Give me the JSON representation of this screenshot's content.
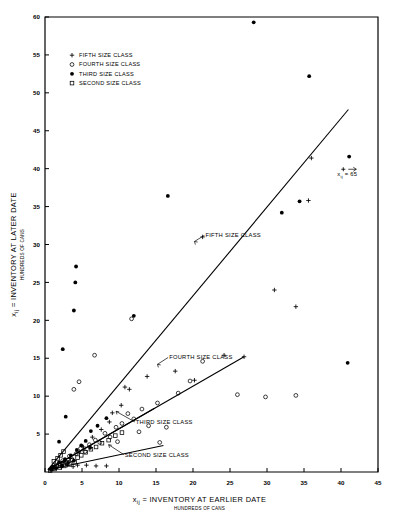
{
  "chart_data": {
    "type": "scatter",
    "title": "",
    "xlabel": "x ij = INVENTORY AT EARLIER DATE",
    "xlabel_sub": "HUNDREDS OF CANS",
    "ylabel": "x ij = INVENTORY AT LATER DATE",
    "ylabel_sub": "HUNDREDS OF CANS",
    "xlim": [
      0,
      45
    ],
    "ylim": [
      0,
      60
    ],
    "xticks": [
      0,
      5,
      10,
      15,
      20,
      25,
      30,
      35,
      40,
      45
    ],
    "xticklabels": [
      "0",
      "5",
      "10",
      "15",
      "20",
      "25",
      "30",
      "35",
      "40",
      "45"
    ],
    "yticks": [
      5,
      10,
      15,
      20,
      25,
      30,
      35,
      40,
      45,
      50,
      55,
      60
    ],
    "yticklabels": [
      "5",
      "10",
      "15",
      "20",
      "25",
      "30",
      "35",
      "40",
      "45",
      "50",
      "55",
      "60"
    ],
    "grid": false,
    "legend_position": "upper-left",
    "legend": [
      {
        "marker": "plus-marker",
        "label": "FIFTH SIZE CLASS"
      },
      {
        "marker": "open-circle-marker",
        "label": "FOURTH SIZE CLASS"
      },
      {
        "marker": "filled-circle-marker",
        "label": "THIRD SIZE CLASS"
      },
      {
        "marker": "open-square-marker",
        "label": "SECOND SIZE CLASS"
      }
    ],
    "annotations": [
      {
        "name": "fifth-size-class-annotation",
        "text": "FIFTH SIZE CLASS",
        "x": 21.0,
        "y": 31.2
      },
      {
        "name": "fourth-size-class-annotation",
        "text": "FOURTH SIZE CLASS",
        "x": 16.1,
        "y": 15.1
      },
      {
        "name": "third-size-class-annotation",
        "text": "THIRD SIZE CLASS",
        "x": 11.6,
        "y": 6.6
      },
      {
        "name": "second-size-class-annotation",
        "text": "SECOND SIZE CLASS",
        "x": 10.1,
        "y": 2.3
      },
      {
        "name": "offscale-point-annotation",
        "text": "x ij = 65",
        "x": 39.5,
        "y": 39.0
      }
    ],
    "series": [
      {
        "name": "FIFTH SIZE CLASS",
        "marker": "plus-marker",
        "points": [
          [
            1.0,
            0.5
          ],
          [
            1.3,
            0.8
          ],
          [
            1.8,
            1.1
          ],
          [
            2.2,
            0.6
          ],
          [
            2.6,
            1.4
          ],
          [
            3.0,
            0.9
          ],
          [
            3.4,
            1.8
          ],
          [
            3.8,
            0.7
          ],
          [
            4.4,
            0.9
          ],
          [
            5.6,
            0.9
          ],
          [
            6.9,
            0.8
          ],
          [
            8.3,
            0.8
          ],
          [
            4.6,
            2.6
          ],
          [
            5.2,
            3.3
          ],
          [
            6.4,
            4.6
          ],
          [
            7.6,
            5.6
          ],
          [
            8.7,
            6.6
          ],
          [
            9.1,
            7.8
          ],
          [
            10.3,
            8.8
          ],
          [
            10.8,
            11.2
          ],
          [
            11.4,
            10.9
          ],
          [
            13.8,
            12.6
          ],
          [
            17.6,
            13.3
          ],
          [
            20.2,
            12.1
          ],
          [
            24.2,
            15.4
          ],
          [
            26.9,
            15.2
          ],
          [
            21.3,
            31.0
          ],
          [
            31.0,
            24.0
          ],
          [
            33.9,
            21.8
          ],
          [
            35.6,
            35.8
          ],
          [
            36.0,
            41.4
          ]
        ]
      },
      {
        "name": "FOURTH SIZE CLASS",
        "marker": "open-circle-marker",
        "points": [
          [
            0.9,
            0.4
          ],
          [
            1.4,
            0.6
          ],
          [
            2.0,
            1.0
          ],
          [
            2.4,
            1.5
          ],
          [
            2.9,
            1.2
          ],
          [
            3.3,
            2.1
          ],
          [
            3.7,
            1.6
          ],
          [
            4.2,
            2.4
          ],
          [
            4.8,
            3.1
          ],
          [
            5.4,
            2.7
          ],
          [
            6.0,
            3.6
          ],
          [
            6.8,
            4.2
          ],
          [
            7.4,
            3.9
          ],
          [
            8.1,
            5.1
          ],
          [
            8.8,
            4.6
          ],
          [
            9.6,
            5.9
          ],
          [
            10.4,
            6.4
          ],
          [
            11.2,
            7.7
          ],
          [
            12.0,
            7.0
          ],
          [
            13.1,
            8.3
          ],
          [
            14.0,
            6.1
          ],
          [
            15.2,
            9.1
          ],
          [
            16.4,
            5.9
          ],
          [
            18.0,
            10.4
          ],
          [
            19.6,
            12.0
          ],
          [
            21.3,
            14.6
          ],
          [
            11.7,
            20.2
          ],
          [
            6.7,
            15.4
          ],
          [
            4.6,
            11.9
          ],
          [
            3.9,
            10.9
          ],
          [
            26.0,
            10.2
          ],
          [
            29.8,
            9.9
          ],
          [
            33.9,
            10.1
          ],
          [
            9.8,
            4.0
          ],
          [
            12.7,
            5.3
          ],
          [
            15.5,
            3.9
          ]
        ]
      },
      {
        "name": "THIRD SIZE CLASS",
        "marker": "filled-circle-marker",
        "points": [
          [
            0.8,
            0.3
          ],
          [
            1.1,
            0.7
          ],
          [
            1.5,
            0.5
          ],
          [
            1.9,
            1.3
          ],
          [
            2.3,
            0.9
          ],
          [
            2.7,
            1.7
          ],
          [
            3.1,
            1.2
          ],
          [
            3.5,
            2.2
          ],
          [
            3.9,
            1.5
          ],
          [
            4.3,
            2.9
          ],
          [
            4.9,
            3.5
          ],
          [
            5.5,
            4.1
          ],
          [
            6.1,
            3.2
          ],
          [
            2.8,
            7.3
          ],
          [
            1.9,
            4.0
          ],
          [
            2.4,
            16.2
          ],
          [
            3.9,
            21.3
          ],
          [
            4.2,
            27.1
          ],
          [
            4.1,
            25.0
          ],
          [
            12.0,
            20.6
          ],
          [
            16.6,
            36.4
          ],
          [
            28.2,
            59.3
          ],
          [
            35.7,
            52.2
          ],
          [
            32.0,
            34.2
          ],
          [
            34.4,
            35.7
          ],
          [
            40.9,
            14.4
          ],
          [
            41.1,
            41.6
          ],
          [
            6.2,
            5.4
          ],
          [
            7.1,
            6.1
          ],
          [
            8.3,
            7.1
          ]
        ]
      },
      {
        "name": "SECOND SIZE CLASS",
        "marker": "open-square-marker",
        "points": [
          [
            0.7,
            0.2
          ],
          [
            1.0,
            0.5
          ],
          [
            1.3,
            0.4
          ],
          [
            1.6,
            0.8
          ],
          [
            2.0,
            0.6
          ],
          [
            2.3,
            1.0
          ],
          [
            2.6,
            0.8
          ],
          [
            3.0,
            1.3
          ],
          [
            3.3,
            1.0
          ],
          [
            3.6,
            1.6
          ],
          [
            4.0,
            1.3
          ],
          [
            4.4,
            1.9
          ],
          [
            4.9,
            2.2
          ],
          [
            5.5,
            2.6
          ],
          [
            6.2,
            3.0
          ],
          [
            6.9,
            3.3
          ],
          [
            7.7,
            3.8
          ],
          [
            8.6,
            4.2
          ],
          [
            9.5,
            4.8
          ],
          [
            10.4,
            5.2
          ],
          [
            2.1,
            2.2
          ],
          [
            2.5,
            2.7
          ],
          [
            1.2,
            1.4
          ],
          [
            1.7,
            1.8
          ]
        ]
      }
    ],
    "fit_lines": [
      {
        "name": "fifth-size-class-fit",
        "x0": 0.4,
        "y0": 0.3,
        "x1": 41.0,
        "y1": 47.8
      },
      {
        "name": "fourth-size-class-fit",
        "x0": 0.4,
        "y0": 0.3,
        "x1": 26.9,
        "y1": 15.2
      },
      {
        "name": "third-size-class-fit",
        "x0": 0.4,
        "y0": 0.3,
        "x1": 14.8,
        "y1": 8.4
      },
      {
        "name": "second-size-class-fit",
        "x0": 0.4,
        "y0": 0.3,
        "x1": 16.0,
        "y1": 3.5
      }
    ]
  }
}
